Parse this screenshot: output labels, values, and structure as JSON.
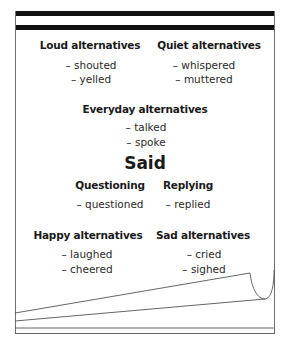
{
  "document": {
    "title": "Said",
    "groups": [
      {
        "heading": "Loud alternatives",
        "items": [
          "– shouted",
          "– yelled"
        ]
      },
      {
        "heading": "Quiet alternatives",
        "items": [
          "– whispered",
          "– muttered"
        ]
      },
      {
        "heading": "Everyday alternatives",
        "items": [
          "– talked",
          "– spoke"
        ]
      },
      {
        "heading": "Questioning",
        "items": [
          "– questioned"
        ]
      },
      {
        "heading": "Replying",
        "items": [
          "– replied"
        ]
      },
      {
        "heading": "Happy alternatives",
        "items": [
          "– laughed",
          "– cheered"
        ]
      },
      {
        "heading": "Sad alternatives",
        "items": [
          "– cried",
          "– sighed"
        ]
      }
    ]
  },
  "colors": {
    "header_band": "#111111",
    "frame": "#6f6f6f",
    "text": "#1a1a1a"
  }
}
